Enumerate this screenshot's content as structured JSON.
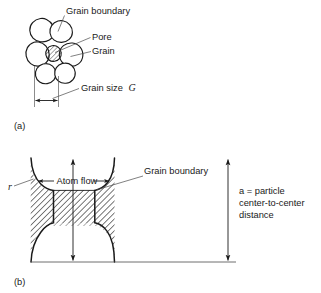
{
  "figure": {
    "background_color": "#ffffff",
    "line_color": "#1a1a1a",
    "leader_color": "#4a4a4a",
    "width": 321,
    "height": 293
  },
  "panel_a": {
    "id": "(a)",
    "labels": {
      "grain_boundary": "Grain boundary",
      "pore": "Pore",
      "grain": "Grain",
      "grain_size": "Grain size",
      "grain_size_symbol": "G"
    }
  },
  "panel_b": {
    "id": "(b)",
    "labels": {
      "atom_flow": "Atom flow",
      "grain_boundary": "Grain boundary",
      "neck_radius_symbol": "r",
      "distance_line_1": "a = particle",
      "distance_line_2": "center-to-center",
      "distance_line_3": "distance"
    }
  }
}
